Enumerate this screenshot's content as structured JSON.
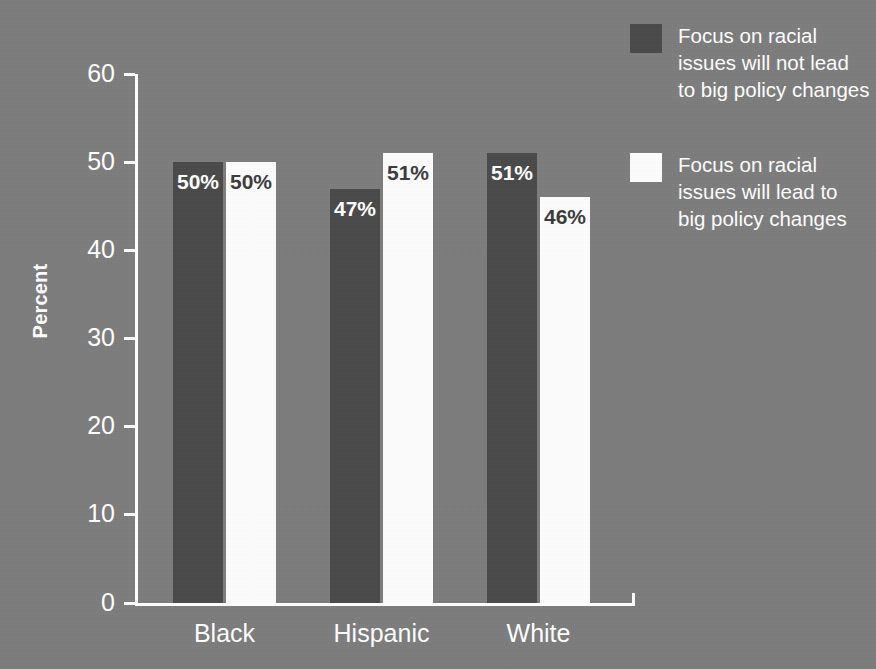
{
  "chart_data": {
    "type": "bar",
    "title": "",
    "xlabel": "",
    "ylabel": "Percent",
    "ylim": [
      0,
      60
    ],
    "yticks": [
      0,
      10,
      20,
      30,
      40,
      50,
      60
    ],
    "ytick_labels": [
      "0",
      "10",
      "20",
      "30",
      "40",
      "50",
      "60"
    ],
    "grid": false,
    "legend_position": "right",
    "categories": [
      "Black",
      "Hispanic",
      "White"
    ],
    "series": [
      {
        "name": "Focus on racial issues will not lead to big policy changes",
        "color": "#4a4a4a",
        "values": [
          50,
          47,
          51
        ],
        "value_labels": [
          "50%",
          "47%",
          "51%"
        ]
      },
      {
        "name": "Focus on racial issues will lead to big policy changes",
        "color": "#ffffff",
        "values": [
          50,
          51,
          46
        ],
        "value_labels": [
          "50%",
          "51%",
          "46%"
        ]
      }
    ]
  },
  "legend": {
    "items": [
      {
        "label": "Focus on racial issues will not lead to big policy changes",
        "swatch": "dark"
      },
      {
        "label": "Focus on racial issues will lead to big policy changes",
        "swatch": "light"
      }
    ]
  },
  "colors": {
    "background": "#7d7d7d",
    "bar_dark": "#4a4a4a",
    "bar_light": "#fdfdfd",
    "axis": "#ffffff",
    "text": "#ffffff",
    "text_on_light": "#3c3c3c"
  }
}
